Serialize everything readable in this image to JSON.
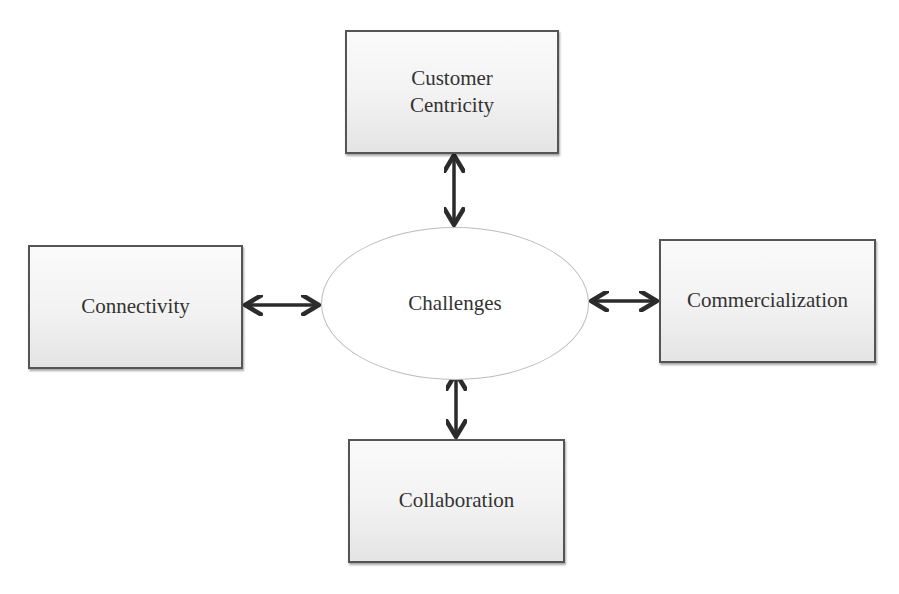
{
  "diagram": {
    "center": {
      "label": "Challenges"
    },
    "nodes": {
      "top": {
        "line1": "Customer",
        "line2": "Centricity"
      },
      "left": {
        "label": "Connectivity"
      },
      "right": {
        "label": "Commercialization"
      },
      "bottom": {
        "label": "Collaboration"
      }
    },
    "edges": [
      {
        "from": "Challenges",
        "to": "Customer Centricity",
        "type": "bidirectional"
      },
      {
        "from": "Challenges",
        "to": "Connectivity",
        "type": "bidirectional"
      },
      {
        "from": "Challenges",
        "to": "Commercialization",
        "type": "bidirectional"
      },
      {
        "from": "Challenges",
        "to": "Collaboration",
        "type": "bidirectional"
      }
    ],
    "colors": {
      "box_border": "#555555",
      "arrow": "#2b2b2b",
      "ellipse_border": "#bdbdbd"
    }
  }
}
